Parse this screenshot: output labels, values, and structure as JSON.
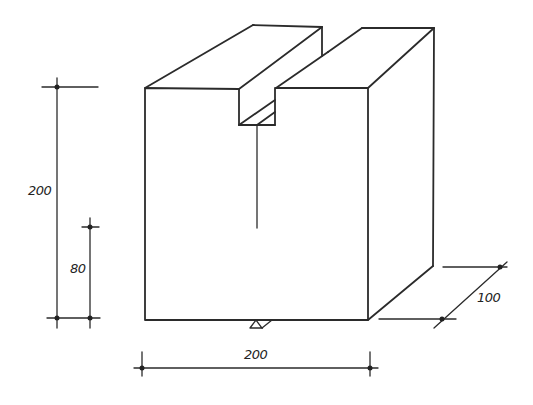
{
  "drawing": {
    "subject": "notched-block-isometric",
    "dimensions": {
      "height_total": "200",
      "notch_depth_label": "80",
      "width": "200",
      "depth": "100"
    },
    "support_symbol": "triangle-support"
  }
}
